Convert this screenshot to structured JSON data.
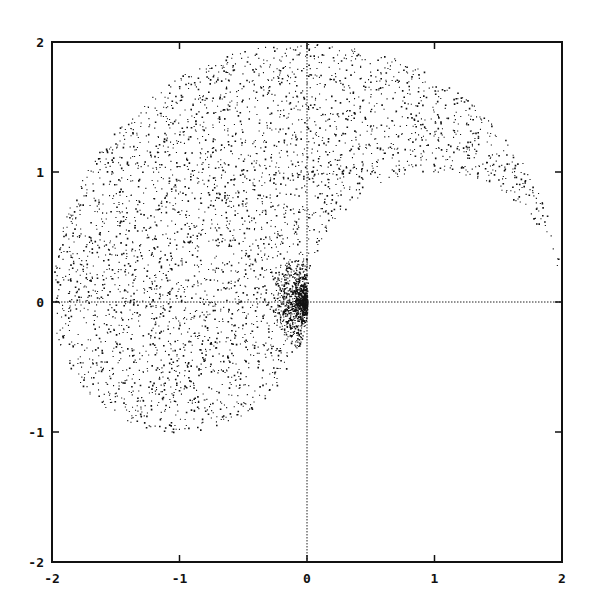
{
  "chart_data": {
    "type": "scatter",
    "title": "",
    "xlabel": "",
    "ylabel": "",
    "xlim": [
      -2,
      2
    ],
    "ylim": [
      -2,
      2
    ],
    "grid": false,
    "legend": null,
    "x_ticks": [
      "-2",
      "-1",
      "0",
      "1",
      "2"
    ],
    "y_ticks": [
      "2",
      "1",
      "0",
      "-1",
      "-2"
    ],
    "zero_axes": "dotted lines at x=0 and y=0",
    "region_description": "Points fill upper half-disk of radius 2 centered at (0,0) plus lower half-disk of radius 1 centered at (-1,0), excluding upper half-disk of radius 1 centered at (1,0); density concentrated near origin (yin-yang / spiral-like shape)",
    "region": {
      "outer_upper_radius": 2,
      "lower_lobe_center": [
        -1,
        0
      ],
      "lower_lobe_radius": 1,
      "excluded_lobe_center": [
        1,
        0
      ],
      "excluded_lobe_radius": 1
    },
    "approx_point_count": 5000,
    "point_color": "#111111"
  }
}
